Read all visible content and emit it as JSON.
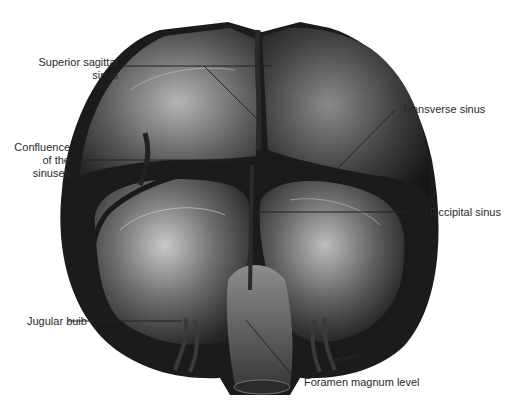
{
  "figure": {
    "signature": "John Sumner"
  },
  "labels": {
    "superior_sagittal": {
      "line1": "Superior sagittal",
      "line2": "sinus"
    },
    "confluence": {
      "line1": "Confluence",
      "line2": "of the",
      "line3": "sinuses"
    },
    "transverse": {
      "text": "Transverse sinus"
    },
    "occipital": {
      "text": "Occipital sinus"
    },
    "jugular": {
      "text": "Jugular buib"
    },
    "foramen": {
      "text": "Foramen magnum level"
    }
  },
  "colors": {
    "background": "#ffffff",
    "dura_dark": "#1e1e1e",
    "dura_mid": "#5a5a5a",
    "dura_light": "#b8b8b8",
    "leader": "#222222"
  }
}
